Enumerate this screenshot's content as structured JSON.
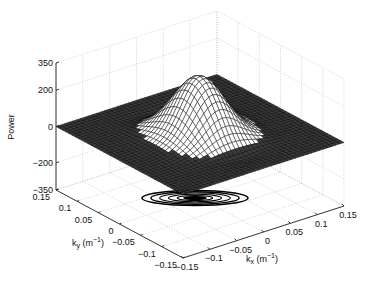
{
  "chart_data": {
    "type": "surface3d",
    "title": "",
    "xlabel": "k_x (m^-1)",
    "ylabel": "k_y (m^-1)",
    "zlabel": "Power",
    "xlim": [
      -0.15,
      0.15
    ],
    "ylim": [
      -0.15,
      0.15
    ],
    "zlim": [
      -350,
      350
    ],
    "x_ticks": [
      "-0.15",
      "-0.1",
      "-0.05",
      "0",
      "0.05",
      "0.1",
      "0.15"
    ],
    "y_ticks": [
      "-0.15",
      "-0.1",
      "-0.05",
      "0",
      "0.05",
      "0.1",
      "0.15"
    ],
    "z_ticks": [
      "-350",
      "-200",
      "0",
      "200",
      "350"
    ],
    "z_tick_values": [
      -350,
      -200,
      0,
      200,
      350
    ],
    "grid": true,
    "surface": {
      "description": "Gaussian-like peak centered at (0,0) with two shallow troughs along the k_y direction, flat elsewhere at 0",
      "peak_value": 320,
      "peak_center": [
        0,
        0
      ],
      "sigma_x": 0.035,
      "sigma_y": 0.045,
      "trough_depth": -40,
      "trough_offset_y": 0.09,
      "mesh_size": 41
    },
    "contour": {
      "plane_z": -350,
      "levels": 6,
      "description": "Concentric elongated ellipse contours projected on floor beneath the peak"
    }
  }
}
